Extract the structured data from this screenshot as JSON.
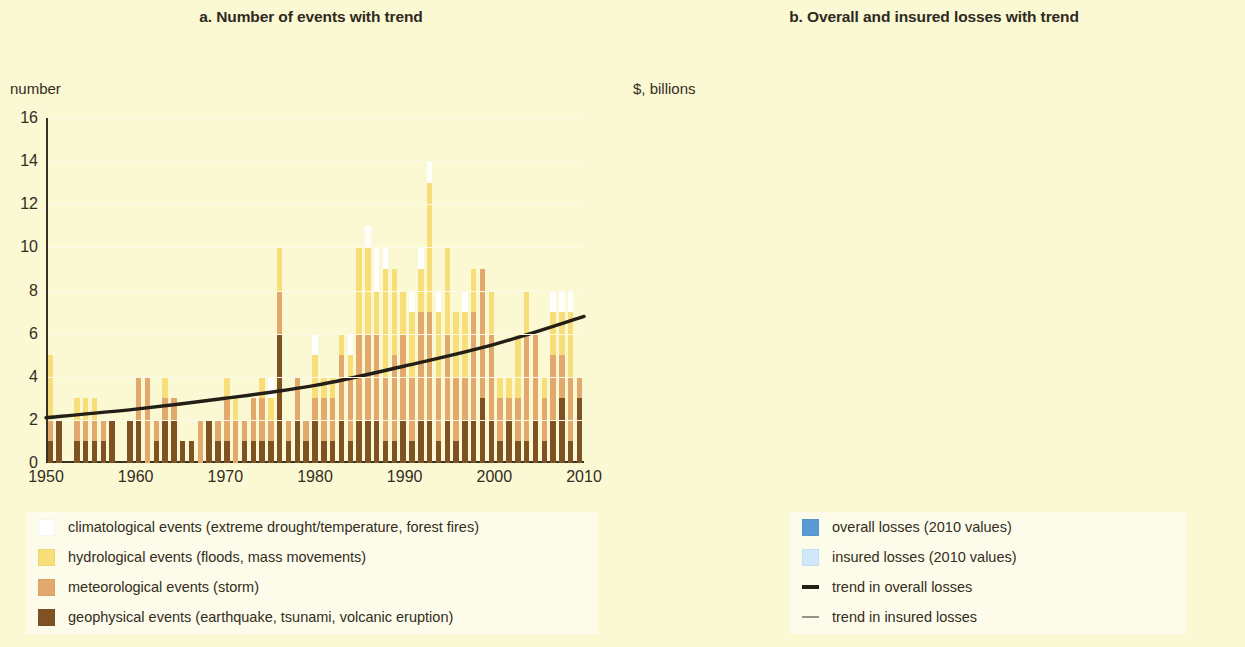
{
  "panels": {
    "a": {
      "title": "a. Number of events with trend",
      "axis_unit": "number"
    },
    "b": {
      "title": "b. Overall and insured losses with trend",
      "axis_unit": "$, billions"
    }
  },
  "legend_a": {
    "items": [
      {
        "label": "climatological events (extreme drought/temperature, forest fires)",
        "color": "#ffffff",
        "type": "swatch"
      },
      {
        "label": "hydrological events (floods, mass movements)",
        "color": "#f7de79",
        "type": "swatch"
      },
      {
        "label": "meteorological events (storm)",
        "color": "#e3a86c",
        "type": "swatch"
      },
      {
        "label": "geophysical events (earthquake, tsunami, volcanic eruption)",
        "color": "#7e5222",
        "type": "swatch"
      }
    ]
  },
  "legend_b": {
    "items": [
      {
        "label": "overall losses (2010 values)",
        "color": "#5b9bd5",
        "type": "swatch"
      },
      {
        "label": "insured losses (2010 values)",
        "color": "#cfe9fa",
        "type": "swatch"
      },
      {
        "label": "trend in overall losses",
        "color": "#241f16",
        "type": "line"
      },
      {
        "label": "trend in insured losses",
        "color": "#9a9488",
        "type": "line"
      }
    ]
  },
  "chart_data": [
    {
      "type": "bar",
      "id": "a",
      "title": "a. Number of events with trend",
      "stacked": true,
      "xlabel": "",
      "ylabel": "number",
      "ylim": [
        0,
        16
      ],
      "yticks": [
        0,
        2,
        4,
        6,
        8,
        10,
        12,
        14,
        16
      ],
      "xlim": [
        1950,
        2010
      ],
      "xticks": [
        1950,
        1960,
        1970,
        1980,
        1990,
        2000,
        2010
      ],
      "grid": true,
      "legend_position": "below-left",
      "x": [
        1950,
        1951,
        1952,
        1953,
        1954,
        1955,
        1956,
        1957,
        1958,
        1959,
        1960,
        1961,
        1962,
        1963,
        1964,
        1965,
        1966,
        1967,
        1968,
        1969,
        1970,
        1971,
        1972,
        1973,
        1974,
        1975,
        1976,
        1977,
        1978,
        1979,
        1980,
        1981,
        1982,
        1983,
        1984,
        1985,
        1986,
        1987,
        1988,
        1989,
        1990,
        1991,
        1992,
        1993,
        1994,
        1995,
        1996,
        1997,
        1998,
        1999,
        2000,
        2001,
        2002,
        2003,
        2004,
        2005,
        2006,
        2007,
        2008,
        2009,
        2010
      ],
      "series": [
        {
          "name": "geophysical events (earthquake, tsunami, volcanic eruption)",
          "color": "#7e5222",
          "values": [
            1,
            2,
            0,
            1,
            1,
            1,
            1,
            2,
            0,
            2,
            2,
            0,
            1,
            2,
            2,
            1,
            1,
            0,
            2,
            1,
            1,
            0,
            1,
            1,
            1,
            1,
            6,
            1,
            2,
            1,
            2,
            1,
            1,
            2,
            1,
            2,
            2,
            2,
            1,
            1,
            2,
            1,
            2,
            2,
            1,
            2,
            1,
            2,
            2,
            3,
            2,
            1,
            2,
            1,
            1,
            2,
            1,
            2,
            3,
            1,
            3
          ]
        },
        {
          "name": "meteorological events (storm)",
          "color": "#e3a86c",
          "values": [
            1,
            0,
            0,
            1,
            1,
            1,
            1,
            0,
            0,
            0,
            2,
            4,
            1,
            1,
            1,
            0,
            0,
            2,
            0,
            1,
            2,
            2,
            1,
            2,
            2,
            1,
            2,
            1,
            2,
            1,
            1,
            2,
            2,
            3,
            3,
            4,
            4,
            4,
            3,
            4,
            4,
            3,
            5,
            5,
            3,
            4,
            3,
            2,
            5,
            6,
            4,
            2,
            1,
            2,
            5,
            4,
            2,
            3,
            2,
            3,
            1
          ]
        },
        {
          "name": "hydrological events (floods, mass movements)",
          "color": "#f7de79",
          "values": [
            3,
            0,
            0,
            1,
            1,
            1,
            0,
            0,
            0,
            0,
            0,
            0,
            0,
            1,
            0,
            0,
            0,
            0,
            0,
            0,
            1,
            1,
            0,
            0,
            1,
            1,
            2,
            0,
            0,
            0,
            2,
            1,
            1,
            1,
            1,
            4,
            4,
            2,
            5,
            4,
            2,
            3,
            2,
            6,
            3,
            4,
            3,
            3,
            2,
            0,
            2,
            1,
            1,
            3,
            2,
            0,
            1,
            2,
            2,
            3,
            0
          ]
        },
        {
          "name": "climatological events (extreme drought/temperature, forest fires)",
          "color": "#ffffff",
          "values": [
            0,
            0,
            0,
            0,
            0,
            0,
            0,
            0,
            0,
            0,
            0,
            0,
            0,
            0,
            0,
            0,
            0,
            0,
            0,
            0,
            0,
            0,
            0,
            0,
            0,
            1,
            0,
            0,
            0,
            0,
            1,
            0,
            0,
            0,
            1,
            0,
            1,
            2,
            1,
            0,
            0,
            1,
            1,
            1,
            1,
            0,
            0,
            1,
            0,
            0,
            0,
            0,
            0,
            0,
            0,
            0,
            0,
            1,
            1,
            1,
            0
          ]
        }
      ],
      "annotations": [
        {
          "name": "trend in number of events",
          "type": "line",
          "color": "#241f16",
          "x": [
            1950,
            1960,
            1970,
            1980,
            1990,
            2000,
            2010
          ],
          "y": [
            2.1,
            2.5,
            3.0,
            3.6,
            4.5,
            5.5,
            6.8
          ]
        }
      ]
    },
    {
      "type": "bar",
      "id": "b",
      "title": "b. Overall and insured losses with trend",
      "stacked": false,
      "overlaid": true,
      "xlabel": "",
      "ylabel": "$, billions",
      "ylim": [
        0,
        250
      ],
      "yticks": [
        0,
        50,
        100,
        150,
        200,
        250
      ],
      "xlim": [
        1950,
        2010
      ],
      "xticks": [
        1950,
        1960,
        1970,
        1980,
        1990,
        2000,
        2010
      ],
      "grid": true,
      "legend_position": "below-right",
      "x": [
        1950,
        1951,
        1952,
        1953,
        1954,
        1955,
        1956,
        1957,
        1958,
        1959,
        1960,
        1961,
        1962,
        1963,
        1964,
        1965,
        1966,
        1967,
        1968,
        1969,
        1970,
        1971,
        1972,
        1973,
        1974,
        1975,
        1976,
        1977,
        1978,
        1979,
        1980,
        1981,
        1982,
        1983,
        1984,
        1985,
        1986,
        1987,
        1988,
        1989,
        1990,
        1991,
        1992,
        1993,
        1994,
        1995,
        1996,
        1997,
        1998,
        1999,
        2000,
        2001,
        2002,
        2003,
        2004,
        2005,
        2006,
        2007,
        2008,
        2009,
        2010
      ],
      "series": [
        {
          "name": "overall losses (2010 values)",
          "color": "#5b9bd5",
          "values": [
            3,
            1,
            11,
            1,
            26,
            7,
            1,
            2,
            1,
            1,
            11,
            2,
            1,
            2,
            8,
            10,
            14,
            2,
            1,
            6,
            8,
            1,
            2,
            1,
            2,
            3,
            10,
            2,
            4,
            14,
            6,
            2,
            7,
            10,
            3,
            14,
            2,
            18,
            12,
            24,
            45,
            34,
            64,
            86,
            53,
            45,
            42,
            26,
            60,
            80,
            29,
            32,
            54,
            33,
            53,
            197,
            27,
            42,
            62,
            29,
            10
          ]
        },
        {
          "name": "insured losses (2010 values)",
          "color": "#cfe9fa",
          "values": [
            0,
            0,
            0,
            0,
            1,
            0,
            0,
            0,
            0,
            0,
            0,
            0,
            0,
            0,
            0,
            1,
            1,
            0,
            0,
            1,
            1,
            0,
            0,
            0,
            0,
            0,
            1,
            0,
            0,
            2,
            1,
            0,
            1,
            2,
            0,
            2,
            0,
            5,
            3,
            7,
            17,
            10,
            26,
            15,
            15,
            15,
            12,
            6,
            17,
            26,
            10,
            12,
            14,
            11,
            20,
            100,
            15,
            20,
            24,
            13,
            7
          ]
        }
      ],
      "annotations": [
        {
          "name": "trend in overall losses",
          "type": "line",
          "color": "#241f16",
          "x": [
            1950,
            1960,
            1970,
            1980,
            1990,
            2000,
            2010
          ],
          "y": [
            3,
            4,
            6,
            10,
            19,
            31,
            47
          ]
        },
        {
          "name": "trend in insured losses",
          "type": "line",
          "color": "#9a9488",
          "x": [
            1950,
            1960,
            1970,
            1980,
            1990,
            2000,
            2010
          ],
          "y": [
            0.5,
            0.8,
            1.5,
            3,
            7,
            15,
            27
          ]
        }
      ]
    }
  ]
}
